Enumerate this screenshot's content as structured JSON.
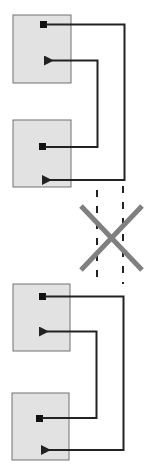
{
  "diagram": {
    "colors": {
      "box_fill": "#e2e2e2",
      "box_stroke": "#707070",
      "line": "#222222",
      "dashed_line": "#222222",
      "cross": "#808080",
      "background": "#ffffff"
    },
    "blocks": [
      {
        "id": "block-1",
        "x": 13,
        "y": 15,
        "w": 58,
        "h": 68
      },
      {
        "id": "block-2",
        "x": 13,
        "y": 120,
        "w": 58,
        "h": 67
      },
      {
        "id": "block-3",
        "x": 13,
        "y": 284,
        "w": 57,
        "h": 67
      },
      {
        "id": "block-4",
        "x": 12,
        "y": 393,
        "w": 57,
        "h": 67
      }
    ],
    "connections": [
      {
        "from": "block-1",
        "to": "block-2",
        "route": "outer"
      },
      {
        "from": "block-2",
        "to": "block-1",
        "route": "inner"
      },
      {
        "from": "block-3",
        "to": "block-4",
        "route": "outer"
      },
      {
        "from": "block-4",
        "to": "block-3",
        "route": "inner"
      }
    ],
    "broken_link": {
      "between": [
        "block-2",
        "block-3"
      ],
      "marker": "cross"
    }
  }
}
